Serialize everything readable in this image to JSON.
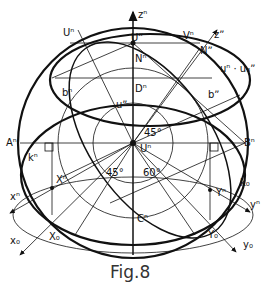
{
  "figure": {
    "caption": "Fig.8",
    "labels": {
      "z_n": "zⁿ",
      "z_star": "zˮ",
      "U_n_top": "Uⁿ",
      "U_star_top": "Uˮ",
      "V_n": "Vⁿ",
      "N_star": "Nˮ",
      "N_n": "Nⁿ",
      "u_eq": "uⁿ · u₃ˮ",
      "b_n": "bⁿ",
      "D_n": "Dⁿ",
      "b_star": "bˮ",
      "u_star": "uˮ",
      "A_n": "Aⁿ",
      "B_n": "Bⁿ",
      "k_n": "kⁿ",
      "k_0": "k₀",
      "X_n": "Xⁿ",
      "x_n": "xⁿ",
      "x_0": "x₀",
      "X_0": "X₀",
      "Y_n": "Yⁿ",
      "y_n": "yⁿ",
      "y_0": "y₀",
      "Y_0": "Y₀",
      "C_n": "Cⁿ",
      "U_n_center": "Uⁿ",
      "angle_45_upper": "45°",
      "angle_45_lower": "45°",
      "angle_60": "60°"
    }
  }
}
